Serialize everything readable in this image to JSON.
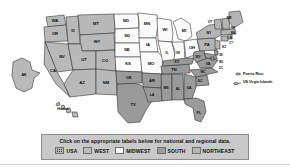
{
  "page": {
    "type": "clickable-image-map"
  },
  "colors": {
    "west": "#b9b9b9",
    "midwest": "#fbfbfb",
    "south": "#9a9a9a",
    "northeast": "#b4b4b4",
    "usa": "#b3b3b3",
    "border": "#2b2b2b",
    "legend_background": "#c9c9c9",
    "legend_border": "#8d8d8d",
    "label_text": "#0a0a0a"
  },
  "legend": {
    "instruction": "Click on the appropriate labels below for national and regional data.",
    "items": [
      {
        "label": "USA",
        "swatch": "usa-swatch",
        "color": "#b3b3b3"
      },
      {
        "label": "WEST",
        "swatch": "west-swatch",
        "color": "#bcbcbc"
      },
      {
        "label": "MIDWEST",
        "swatch": "midwest-swatch",
        "color": "#fcfcfc"
      },
      {
        "label": "SOUTH",
        "swatch": "south-swatch",
        "color": "#9c9c9c"
      },
      {
        "label": "NORTHEAST",
        "swatch": "northeast-swatch",
        "color": "#b6b6b6"
      }
    ]
  },
  "callouts": [
    {
      "label": "Puerto Rico",
      "icon": "territory-marker-icon"
    },
    {
      "label": "US Virgin Islands",
      "icon": "territory-marker-icon"
    }
  ],
  "insets": [
    {
      "label": "AK",
      "name": "Alaska"
    },
    {
      "label": "Hawaii",
      "name": "Hawaii"
    }
  ],
  "regions": {
    "west": {
      "name": "WEST",
      "states": [
        "WA",
        "OR",
        "ID",
        "MT",
        "WY",
        "NV",
        "UT",
        "CO",
        "CA",
        "AZ",
        "NM",
        "AK",
        "Hawaii"
      ]
    },
    "midwest": {
      "name": "MIDWEST",
      "states": [
        "ND",
        "SD",
        "NE",
        "KS",
        "MN",
        "IA",
        "MO",
        "WI",
        "IL",
        "IN",
        "MI",
        "OH"
      ]
    },
    "south": {
      "name": "SOUTH",
      "states": [
        "TX",
        "OK",
        "AR",
        "LA",
        "MS",
        "AL",
        "TN",
        "KY",
        "WV",
        "VA",
        "NC",
        "SC",
        "GA",
        "FL",
        "MD",
        "DE",
        "DC"
      ]
    },
    "northeast": {
      "name": "NORTHEAST",
      "states": [
        "PA",
        "NY",
        "NJ",
        "CT",
        "RI",
        "MA",
        "VT",
        "NH",
        "ME"
      ]
    }
  },
  "state_labels": {
    "WA": "WA",
    "OR": "OR",
    "ID": "ID",
    "MT": "MT",
    "WY": "WY",
    "NV": "NV",
    "UT": "UT",
    "CO": "CO",
    "CA": "CA",
    "AZ": "AZ",
    "NM": "NM",
    "ND": "ND",
    "SD": "SD",
    "NE": "NE",
    "KS": "KS",
    "MN": "MN",
    "IA": "IA",
    "MO": "MO",
    "WI": "WI",
    "IL": "IL",
    "IN": "IN",
    "MI": "MI",
    "OH": "OH",
    "TX": "TX",
    "OK": "OK",
    "AR": "AR",
    "LA": "LA",
    "MS": "MS",
    "AL": "AL",
    "TN": "TN",
    "KY": "KY",
    "WV": "WV",
    "VA": "VA",
    "NC": "NC",
    "SC": "SC",
    "GA": "GA",
    "FL": "FL",
    "MD": "MD",
    "DE": "DE",
    "DC": "DC",
    "PA": "PA",
    "NY": "NY",
    "NJ": "NJ",
    "CT": "CT",
    "RI": "RI",
    "MA": "MA",
    "VT": "VT",
    "NH": "NH",
    "ME": "ME",
    "AK": "AK",
    "HI": "Hawaii"
  }
}
